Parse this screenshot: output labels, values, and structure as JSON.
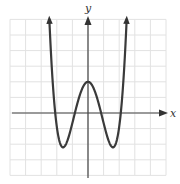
{
  "chart_data": {
    "type": "line",
    "title": "",
    "xlabel": "x",
    "ylabel": "y",
    "xlim": [
      -5,
      5
    ],
    "ylim": [
      -4,
      6
    ],
    "grid": true,
    "grid_step": 1,
    "tick_labels": false,
    "series": [
      {
        "name": "y = f(x) (quartic, W-shaped)",
        "approx_formula": "y = 0.64x^4 - 3.28x^2 + 2",
        "x": [
          -2.6,
          -2.4,
          -2.2,
          -2.1,
          -2.0,
          -1.8,
          -1.6,
          -1.4,
          -1.2,
          -1.0,
          -0.84,
          -0.6,
          -0.4,
          -0.2,
          0,
          0.2,
          0.4,
          0.6,
          0.84,
          1.0,
          1.2,
          1.4,
          1.6,
          1.8,
          2.0,
          2.1,
          2.2,
          2.4,
          2.6
        ],
        "y": [
          6.1,
          2.4,
          0.6,
          0.0,
          -0.9,
          -1.9,
          -2.2,
          -1.97,
          -1.4,
          -0.64,
          0.0,
          0.9,
          1.49,
          1.87,
          2.0,
          1.87,
          1.49,
          0.9,
          0.0,
          -0.64,
          -1.4,
          -1.97,
          -2.2,
          -1.9,
          -0.9,
          0.0,
          0.6,
          2.4,
          6.1
        ]
      }
    ],
    "features": {
      "local_max": [
        0,
        2
      ],
      "local_min": [
        [
          -1.6,
          -2.2
        ],
        [
          1.6,
          -2.2
        ]
      ],
      "x_intercepts": [
        -2.1,
        -0.84,
        0.84,
        2.1
      ],
      "y_intercept": 2,
      "end_behavior": "both ends rise to +infinity (arrows)"
    }
  },
  "labels": {
    "x_axis": "x",
    "y_axis": "y"
  }
}
